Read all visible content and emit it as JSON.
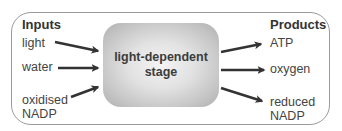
{
  "diagram": {
    "center": {
      "line1": "light-dependent",
      "line2": "stage"
    },
    "inputs": {
      "heading": "Inputs",
      "items": [
        {
          "lines": [
            "light"
          ]
        },
        {
          "lines": [
            "water"
          ]
        },
        {
          "lines": [
            "oxidised",
            "NADP"
          ]
        }
      ]
    },
    "products": {
      "heading": "Products",
      "items": [
        {
          "lines": [
            "ATP"
          ]
        },
        {
          "lines": [
            "oxygen"
          ]
        },
        {
          "lines": [
            "reduced",
            "NADP"
          ]
        }
      ]
    },
    "colors": {
      "frame_border": "#9a9a9a",
      "arrow": "#333333",
      "stage_center": "#f4f4f4",
      "stage_edge": "#b0b0b0",
      "text": "#444444"
    }
  }
}
